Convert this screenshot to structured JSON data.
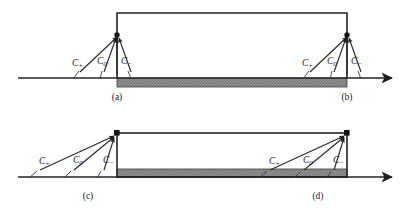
{
  "figure": {
    "background_color": "#ffffff",
    "line_color": "#242424",
    "band_color": "#8c8c8c",
    "width": 410,
    "height": 218
  },
  "labels": {
    "c_plus": "C",
    "c_plus_sub": "+",
    "c_zero": "C",
    "c_zero_sub": "0",
    "c_minus": "C",
    "c_minus_sub": "−"
  },
  "panels": [
    {
      "id": "a",
      "caption": "(a)",
      "apex_x": 117,
      "apex_y": 35,
      "label_positions": [
        {
          "name": "c_plus",
          "x": 72,
          "y": 66
        },
        {
          "name": "c_zero",
          "x": 97,
          "y": 64
        },
        {
          "name": "c_minus",
          "x": 121,
          "y": 64
        }
      ]
    },
    {
      "id": "b",
      "caption": "(b)",
      "apex_x": 347,
      "apex_y": 35,
      "label_positions": [
        {
          "name": "c_plus",
          "x": 302,
          "y": 66
        },
        {
          "name": "c_zero",
          "x": 327,
          "y": 64
        },
        {
          "name": "c_minus",
          "x": 351,
          "y": 64
        }
      ]
    },
    {
      "id": "c",
      "caption": "(c)",
      "apex_x": 117,
      "apex_y": 133,
      "label_positions": [
        {
          "name": "c_plus",
          "x": 30,
          "y": 163
        },
        {
          "name": "c_zero",
          "x": 65,
          "y": 163
        },
        {
          "name": "c_minus",
          "x": 98,
          "y": 163
        }
      ]
    },
    {
      "id": "d",
      "caption": "(d)",
      "apex_x": 347,
      "apex_y": 133,
      "label_positions": [
        {
          "name": "c_plus",
          "x": 262,
          "y": 163
        },
        {
          "name": "c_zero",
          "x": 297,
          "y": 163
        },
        {
          "name": "c_minus",
          "x": 330,
          "y": 163
        }
      ]
    }
  ],
  "captions": {
    "a": "(a)",
    "b": "(b)",
    "c": "(c)",
    "d": "(d)"
  },
  "axes": {
    "top": {
      "x_start": 18,
      "x_end": 396,
      "y": 78
    },
    "bottom": {
      "x_start": 18,
      "x_end": 396,
      "y": 177
    }
  },
  "rectangles": {
    "top": {
      "x": 117,
      "y": 13,
      "width": 230,
      "height": 65
    },
    "bottom": {
      "x": 117,
      "y": 133,
      "width": 230,
      "height": 44
    }
  },
  "bands": {
    "top": {
      "x": 117,
      "y": 78,
      "width": 230,
      "height": 9
    },
    "bottom": {
      "x": 117,
      "y": 169,
      "width": 230,
      "height": 8
    }
  }
}
